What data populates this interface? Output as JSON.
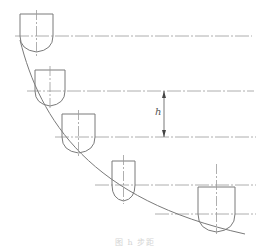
{
  "diagram": {
    "type": "cutter-step-down-on-curved-surface",
    "stroke_color": "#7a7a7a",
    "centerline_color": "#9a9a9a",
    "dimension": {
      "label": "h",
      "x": 164,
      "y_top": 91,
      "y_bottom": 137,
      "label_x": 155,
      "label_y": 106
    },
    "centerlines": [
      {
        "y": 36,
        "x1": 15,
        "x2": 252
      },
      {
        "y": 91,
        "x1": 27,
        "x2": 254
      },
      {
        "y": 137,
        "x1": 55,
        "x2": 256
      },
      {
        "y": 185,
        "x1": 95,
        "x2": 256
      },
      {
        "y": 214,
        "x1": 155,
        "x2": 256
      }
    ],
    "cutters": [
      {
        "x": 20,
        "w": 33,
        "top": 14,
        "shoulder": 36,
        "bottom": 52,
        "axis_top": 10,
        "axis_bottom": 56
      },
      {
        "x": 35,
        "w": 30,
        "top": 70,
        "shoulder": 91,
        "bottom": 106,
        "axis_top": 66,
        "axis_bottom": 110
      },
      {
        "x": 62,
        "w": 33,
        "top": 114,
        "shoulder": 137,
        "bottom": 153,
        "axis_top": 110,
        "axis_bottom": 157
      },
      {
        "x": 112,
        "w": 23,
        "top": 161,
        "shoulder": 185,
        "bottom": 201,
        "axis_top": 155,
        "axis_bottom": 204
      },
      {
        "x": 198,
        "w": 37,
        "top": 187,
        "shoulder": 214,
        "bottom": 232,
        "axis_top": 164,
        "axis_bottom": 234
      }
    ],
    "surface_curve": "M 20 40 C 40 120, 90 200, 245 234",
    "caption": "图 h 步距"
  }
}
